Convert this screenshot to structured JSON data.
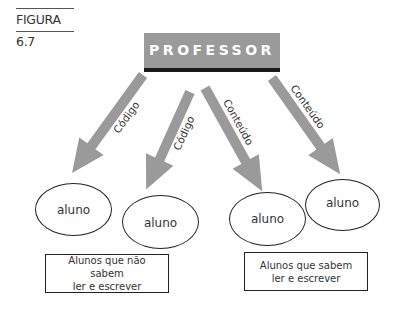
{
  "figure_label": "FIGURA 6.7",
  "teacher": {
    "label": "PROFESSOR"
  },
  "arrows": [
    {
      "label": "Código",
      "target": "aluno-1"
    },
    {
      "label": "Código",
      "target": "aluno-2"
    },
    {
      "label": "Conteúdo",
      "target": "aluno-3"
    },
    {
      "label": "Conteúdo",
      "target": "aluno-4"
    }
  ],
  "students": [
    {
      "label": "aluno"
    },
    {
      "label": "aluno"
    },
    {
      "label": "aluno"
    },
    {
      "label": "aluno"
    }
  ],
  "groups": [
    {
      "line1": "Alunos que não sabem",
      "line2": "ler e escrever"
    },
    {
      "line1": "Alunos que sabem",
      "line2": "ler e escrever"
    }
  ],
  "colors": {
    "arrow": "#9a9a9a",
    "teacher_box": "#9a9a9a",
    "teacher_bar": "#1a1a1a",
    "outline": "#222222"
  }
}
